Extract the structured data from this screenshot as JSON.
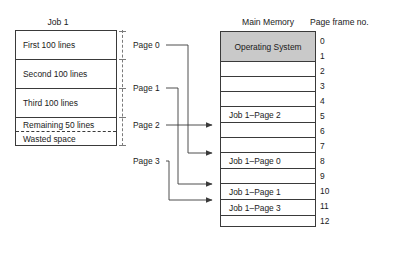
{
  "figure": {
    "type": "diagram"
  },
  "job": {
    "title": "Job 1",
    "segments": [
      {
        "label": "First 100 lines"
      },
      {
        "label": "Second 100 lines"
      },
      {
        "label": "Third 100 lines"
      },
      {
        "label": "Remaining 50 lines"
      },
      {
        "label": "Wasted space"
      }
    ]
  },
  "page_labels": [
    {
      "label": "Page 0"
    },
    {
      "label": "Page 1"
    },
    {
      "label": "Page 2"
    },
    {
      "label": "Page 3"
    }
  ],
  "memory": {
    "title": "Main Memory",
    "frame_column_title": "Page frame no.",
    "os_label": "Operating System",
    "os_fill": "#c9c9c9",
    "rows": [
      {
        "label": "Operating System",
        "kind": "os",
        "frames": [
          0,
          1
        ]
      },
      {
        "label": "",
        "kind": "empty",
        "frames": [
          2
        ]
      },
      {
        "label": "",
        "kind": "empty",
        "frames": [
          3
        ]
      },
      {
        "label": "",
        "kind": "empty",
        "frames": [
          4
        ]
      },
      {
        "label": "Job 1–Page 2",
        "kind": "job",
        "frames": [
          5
        ]
      },
      {
        "label": "",
        "kind": "empty",
        "frames": [
          6
        ]
      },
      {
        "label": "",
        "kind": "empty",
        "frames": [
          7
        ]
      },
      {
        "label": "Job 1–Page 0",
        "kind": "job",
        "frames": [
          8
        ]
      },
      {
        "label": "",
        "kind": "empty",
        "frames": [
          9
        ]
      },
      {
        "label": "Job 1–Page 1",
        "kind": "job",
        "frames": [
          10
        ]
      },
      {
        "label": "Job 1–Page 3",
        "kind": "job",
        "frames": [
          11
        ]
      },
      {
        "label": "",
        "kind": "empty",
        "frames": [
          12
        ]
      }
    ],
    "frame_numbers": [
      "0",
      "1",
      "2",
      "3",
      "4",
      "5",
      "6",
      "7",
      "8",
      "9",
      "10",
      "11",
      "12"
    ]
  },
  "mapping": [
    {
      "page": "Page 0",
      "frame": "8"
    },
    {
      "page": "Page 1",
      "frame": "10"
    },
    {
      "page": "Page 2",
      "frame": "5"
    },
    {
      "page": "Page 3",
      "frame": "11"
    }
  ],
  "colors": {
    "line": "#3a3a3a",
    "dashed": "#7a7a7a",
    "os_fill": "#c9c9c9",
    "text": "#1a1a1a",
    "background": "#ffffff"
  }
}
